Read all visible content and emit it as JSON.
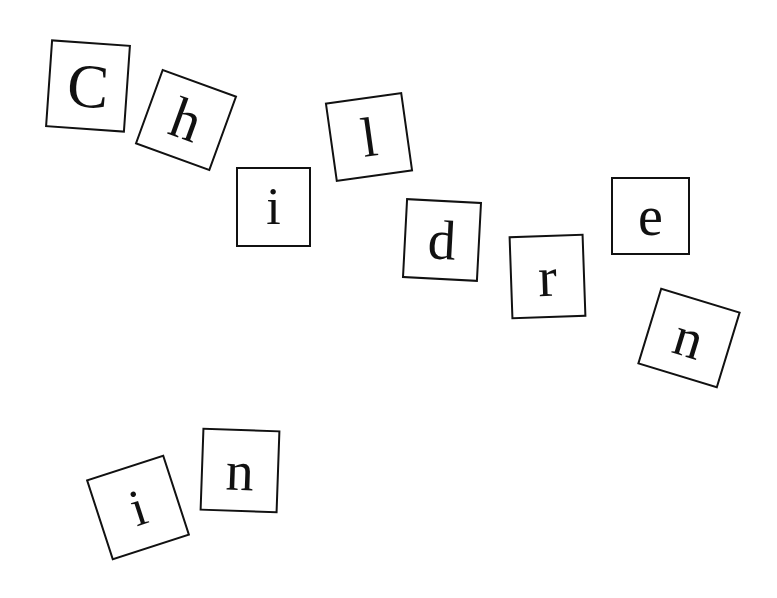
{
  "tiles": [
    {
      "letter": "C",
      "x": 48,
      "y": 42,
      "w": 80,
      "h": 88,
      "rot": 4,
      "size": 62
    },
    {
      "letter": "h",
      "x": 146,
      "y": 80,
      "w": 80,
      "h": 80,
      "rot": 20,
      "size": 58
    },
    {
      "letter": "i",
      "x": 236,
      "y": 167,
      "w": 75,
      "h": 80,
      "rot": 0,
      "size": 52
    },
    {
      "letter": "l",
      "x": 330,
      "y": 97,
      "w": 78,
      "h": 80,
      "rot": -8,
      "size": 56
    },
    {
      "letter": "d",
      "x": 404,
      "y": 200,
      "w": 76,
      "h": 80,
      "rot": 3,
      "size": 56
    },
    {
      "letter": "r",
      "x": 510,
      "y": 235,
      "w": 75,
      "h": 83,
      "rot": -2,
      "size": 56
    },
    {
      "letter": "e",
      "x": 611,
      "y": 177,
      "w": 79,
      "h": 78,
      "rot": 0,
      "size": 56
    },
    {
      "letter": "n",
      "x": 647,
      "y": 298,
      "w": 84,
      "h": 80,
      "rot": 17,
      "size": 56
    },
    {
      "letter": "i",
      "x": 97,
      "y": 465,
      "w": 82,
      "h": 85,
      "rot": -18,
      "size": 52
    },
    {
      "letter": "n",
      "x": 201,
      "y": 429,
      "w": 78,
      "h": 83,
      "rot": 2,
      "size": 56
    }
  ]
}
